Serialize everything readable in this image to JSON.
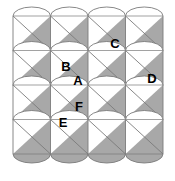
{
  "figure": {
    "type": "geometric-tiling",
    "canvas": {
      "width": 175,
      "height": 181
    },
    "grid": {
      "columns": 4,
      "rows": 4,
      "origin_x": 13,
      "origin_y": 16,
      "cell_width": 37.5,
      "cell_height": 34.5
    },
    "colors": {
      "background": "#ffffff",
      "shade_fill": "#a8a8a8",
      "stroke": "#7a7a7a",
      "label_text": "#000000"
    },
    "tile": {
      "description": "square cell with top-left to bottom-right diagonal, shaded lower-right triangle, and elliptical arcs bulging from top and bottom edges",
      "arc_rise": 9,
      "diagonal": "top-left to bottom-right",
      "shaded_half": "lower-right"
    },
    "labels": [
      {
        "id": "A",
        "text": "A",
        "x": 78,
        "y": 82
      },
      {
        "id": "B",
        "text": "B",
        "x": 66,
        "y": 68
      },
      {
        "id": "C",
        "text": "C",
        "x": 115,
        "y": 45
      },
      {
        "id": "D",
        "text": "D",
        "x": 152,
        "y": 80
      },
      {
        "id": "E",
        "text": "E",
        "x": 63,
        "y": 124
      },
      {
        "id": "F",
        "text": "F",
        "x": 79,
        "y": 108
      }
    ]
  }
}
